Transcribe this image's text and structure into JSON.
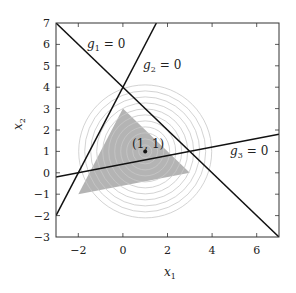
{
  "figure": {
    "type": "feasible-region-diagram",
    "xlim": [
      -3,
      7
    ],
    "ylim": [
      -3,
      7
    ],
    "xticks": [
      "−2",
      "0",
      "2",
      "4",
      "6"
    ],
    "yticks": [
      "7",
      "6",
      "5",
      "4",
      "3",
      "2",
      "1",
      "0",
      "−1",
      "−2",
      "−3"
    ],
    "xlabel": {
      "var": "x",
      "sub": "1"
    },
    "ylabel": {
      "var": "x",
      "sub": "2"
    },
    "constraints": [
      {
        "name": "g",
        "sub": "1",
        "rhs": "= 0",
        "equation": "x1 + x2 = 4"
      },
      {
        "name": "g",
        "sub": "2",
        "rhs": "= 0",
        "equation": "x2 = 2 x1 + 4"
      },
      {
        "name": "g",
        "sub": "3",
        "rhs": "= 0",
        "equation": "x2 = 0.2 x1 + 0.4"
      }
    ],
    "feasible_region_vertices": [
      [
        0,
        4
      ],
      [
        -2,
        0
      ],
      [
        3,
        1
      ]
    ],
    "point_label": "(1, 1)",
    "point": [
      1,
      1
    ],
    "contour_center": [
      1,
      1
    ],
    "contour_count": 11,
    "colors": {
      "region_fill": "#b4b4b4",
      "contour": "#c8c8c8",
      "line": "#111111",
      "axis": "#333333"
    }
  }
}
